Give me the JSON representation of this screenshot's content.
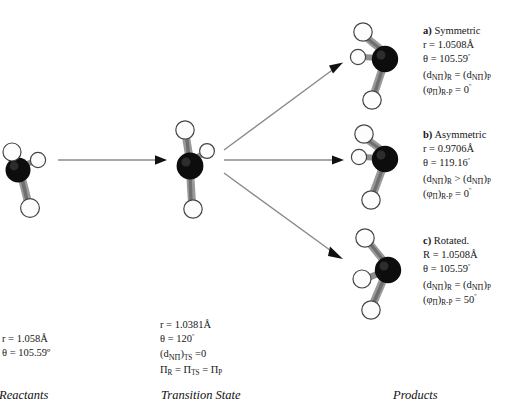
{
  "figure": {
    "type": "reaction-pathway-diagram",
    "atom_colors": {
      "nitrogen": "#111111",
      "hydrogen": "#ffffff",
      "bond": "#8a8a8a",
      "outline": "#3a3a3a"
    },
    "arrow_color": "#7a7a7a",
    "arrowhead_color": "#000000"
  },
  "stages": {
    "reactants": {
      "label": "Reactants",
      "lines": [
        "r = 1.058Å",
        "θ = 105.59º"
      ]
    },
    "transition_state": {
      "label": "Transition State",
      "lines": [
        "r = 1.0381Å",
        "θ = 120º",
        "(dₙΠ)ₜₛ =0",
        "Πᵣ = Πₜₛ = Πₚ"
      ],
      "line1": "r = 1.0381Å",
      "line2_prefix": "θ = ",
      "line2_value": "120",
      "line3": "(d",
      "line4": "Π"
    },
    "products": {
      "label": "Products"
    }
  },
  "products": [
    {
      "key": "a",
      "tag": "a)",
      "title": "Symmetric",
      "r_label": "r = ",
      "r_value": "1.0508Å",
      "theta_label": "θ = ",
      "theta_value": "105.59",
      "d_relation": "=",
      "phi_value": "0"
    },
    {
      "key": "b",
      "tag": "b)",
      "title": "Asymmetric",
      "r_label": "r = ",
      "r_value": "0.9706Å",
      "theta_label": "θ = ",
      "theta_value": "119.16",
      "d_relation": ">",
      "phi_value": "0"
    },
    {
      "key": "c",
      "tag": "c)",
      "title": "Rotated.",
      "r_label": "R = ",
      "r_value": "1.0508Å",
      "theta_label": "θ = ",
      "theta_value": "105.59",
      "d_relation": "=",
      "phi_value": "50"
    }
  ],
  "symbols": {
    "angstrom": "Å",
    "theta": "θ",
    "phi": "φ",
    "pi": "Π",
    "degree": "º",
    "d": "d",
    "sub_NPi": "NΠ",
    "sub_R": "R",
    "sub_P": "P",
    "sub_TS": "TS",
    "sub_RP": "R-P",
    "equals": "=",
    "open_paren": "(",
    "close_paren": ")"
  },
  "arrows": {
    "main": "reactants-to-transition-state",
    "branch_a": "transition-state-to-product-a",
    "branch_b": "transition-state-to-product-b",
    "branch_c": "transition-state-to-product-c"
  }
}
